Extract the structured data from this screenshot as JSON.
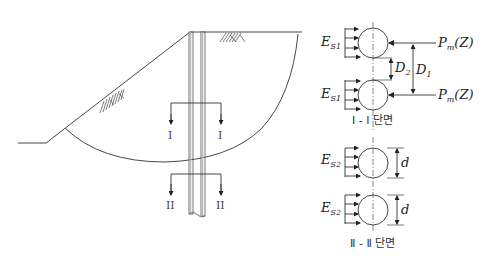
{
  "diagram": {
    "type": "slope-stabilizing-pile-cross-section",
    "left": {
      "section_I_label_left": "I",
      "section_I_label_right": "I",
      "section_II_label_left": "II",
      "section_II_label_right": "II"
    },
    "right": {
      "section_I": {
        "es_label_main": "E",
        "es_label_sub": "S1",
        "pm_label": "P",
        "pm_sub": "m",
        "pm_arg": "(Z)",
        "d1_label": "D",
        "d1_sub": "1",
        "d2_label": "D",
        "d2_sub": "2",
        "caption": "Ⅰ - Ⅰ 단면"
      },
      "section_II": {
        "es_label_main": "E",
        "es_label_sub": "S2",
        "d_label": "d",
        "caption": "Ⅱ - Ⅱ 단면"
      }
    }
  }
}
